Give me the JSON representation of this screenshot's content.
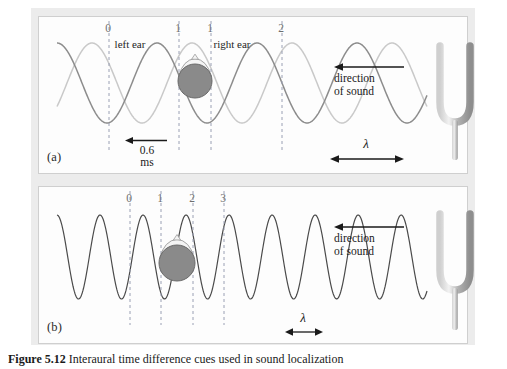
{
  "figure": {
    "caption_label": "Figure 5.12",
    "caption_text": "Interaural time difference cues used in sound localization",
    "background_color": "#ffffff",
    "frame_color": "#ececec",
    "panel_background": "#fdfdfd"
  },
  "panel_a": {
    "id": "(a)",
    "tick_labels": [
      "0",
      "1",
      "1",
      "2"
    ],
    "ear_labels": [
      "left ear",
      "right ear"
    ],
    "direction_line1": "direction",
    "direction_line2": "of sound",
    "delay_value": "0.6",
    "delay_unit": "ms",
    "wavelength_symbol": "λ",
    "wave_near_color": "#8c8c8c",
    "wave_far_color": "#c9c9c9",
    "dashline_color": "#9aa0b4",
    "head_fill": "#8a8a8a",
    "head_stroke": "#6a6a6a",
    "fork_color": "#b4b4b4",
    "cycles": 3.7,
    "phase_shift_fraction": 0.35
  },
  "panel_b": {
    "id": "(b)",
    "tick_labels": [
      "0",
      "1",
      "2",
      "3"
    ],
    "direction_line1": "direction",
    "direction_line2": "of sound",
    "wavelength_symbol": "λ",
    "wave_color": "#4a4a4a",
    "dashline_color": "#9aa0b4",
    "head_fill": "#8a8a8a",
    "head_stroke": "#6a6a6a",
    "fork_color": "#b4b4b4",
    "cycles": 8.6
  },
  "chart_data": {
    "type": "line",
    "xlabel": "",
    "ylabel": "",
    "panels": [
      {
        "name": "(a) low frequency",
        "series": [
          {
            "name": "wave at right ear",
            "color": "#8c8c8c",
            "cycles": 3.7,
            "phase": 0.0
          },
          {
            "name": "wave at left ear",
            "color": "#c9c9c9",
            "cycles": 3.7,
            "phase": 0.35
          }
        ],
        "markers": [
          {
            "label": "0",
            "x_px": 70
          },
          {
            "label": "1",
            "x_px": 140
          },
          {
            "label": "1",
            "x_px": 172
          },
          {
            "label": "2",
            "x_px": 243
          }
        ],
        "annotations": [
          "left ear",
          "right ear",
          "0.6 ms",
          "direction of sound",
          "λ"
        ]
      },
      {
        "name": "(b) high frequency",
        "series": [
          {
            "name": "wave",
            "color": "#4a4a4a",
            "cycles": 8.6,
            "phase": 0.0
          }
        ],
        "markers": [
          {
            "label": "0",
            "x_px": 91
          },
          {
            "label": "1",
            "x_px": 122
          },
          {
            "label": "2",
            "x_px": 154
          },
          {
            "label": "3",
            "x_px": 185
          }
        ],
        "annotations": [
          "direction of sound",
          "λ"
        ]
      }
    ]
  }
}
